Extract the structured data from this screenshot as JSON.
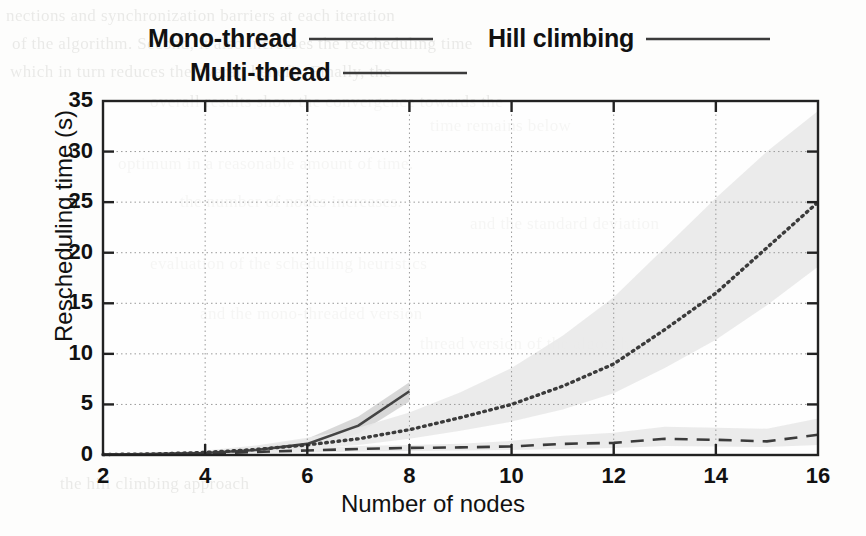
{
  "chart_data": {
    "type": "line",
    "title": "",
    "xlabel": "Number of nodes",
    "ylabel": "Rescheduling time (s)",
    "xlim": [
      2,
      16
    ],
    "ylim": [
      0,
      35
    ],
    "xticks": [
      2,
      4,
      6,
      8,
      10,
      12,
      14,
      16
    ],
    "yticks": [
      0,
      5,
      10,
      15,
      20,
      25,
      30,
      35
    ],
    "grid": true,
    "legend_position": "above-plot",
    "x": [
      2,
      3,
      4,
      5,
      6,
      7,
      8,
      9,
      10,
      11,
      12,
      13,
      14,
      15,
      16
    ],
    "series": [
      {
        "name": "Mono-thread",
        "style": "solid",
        "color": "#444444",
        "x": [
          2,
          3,
          4,
          5,
          6,
          7,
          8
        ],
        "values": [
          0.05,
          0.1,
          0.2,
          0.5,
          1.1,
          2.9,
          6.3
        ],
        "band_low": [
          0.02,
          0.05,
          0.12,
          0.3,
          0.7,
          2.1,
          5.3
        ],
        "band_high": [
          0.1,
          0.18,
          0.35,
          0.8,
          1.6,
          3.8,
          7.2
        ]
      },
      {
        "name": "Multi-thread",
        "style": "dashed",
        "color": "#3b3b3b",
        "x": [
          2,
          3,
          4,
          5,
          6,
          7,
          8,
          9,
          10,
          11,
          12,
          13,
          14,
          15,
          16
        ],
        "values": [
          0.05,
          0.08,
          0.15,
          0.3,
          0.45,
          0.6,
          0.7,
          0.75,
          0.85,
          1.1,
          1.2,
          1.6,
          1.5,
          1.35,
          2.0
        ],
        "band_low": [
          0.02,
          0.04,
          0.08,
          0.15,
          0.25,
          0.35,
          0.4,
          0.45,
          0.5,
          0.6,
          0.7,
          0.9,
          0.85,
          0.8,
          1.0
        ],
        "band_high": [
          0.1,
          0.14,
          0.25,
          0.5,
          0.7,
          0.9,
          1.0,
          1.1,
          1.4,
          1.9,
          2.2,
          2.8,
          2.7,
          2.6,
          3.6
        ]
      },
      {
        "name": "Hill climbing",
        "style": "dotted",
        "color": "#3b3b3b",
        "x": [
          2,
          3,
          4,
          5,
          6,
          7,
          8,
          9,
          10,
          11,
          12,
          13,
          14,
          15,
          16
        ],
        "values": [
          0.05,
          0.1,
          0.25,
          0.55,
          1.0,
          1.6,
          2.5,
          3.7,
          5.0,
          6.8,
          9.0,
          12.4,
          16.0,
          20.5,
          25.0
        ],
        "band_low": [
          0.02,
          0.05,
          0.15,
          0.35,
          0.6,
          1.0,
          1.6,
          2.4,
          3.3,
          4.5,
          6.1,
          8.6,
          11.4,
          14.8,
          18.6
        ],
        "band_high": [
          0.12,
          0.22,
          0.45,
          0.95,
          1.7,
          2.7,
          4.2,
          6.2,
          8.6,
          11.8,
          15.6,
          20.5,
          25.4,
          30.0,
          34.0
        ]
      }
    ]
  },
  "legend": {
    "items": [
      {
        "label": "Mono-thread",
        "style": "solid"
      },
      {
        "label": "Multi-thread",
        "style": "solid"
      },
      {
        "label": "Hill climbing",
        "style": "solid"
      }
    ]
  },
  "axes": {
    "y_title": "Rescheduling time (s)",
    "x_title": "Number of nodes",
    "y_ticks": [
      "0",
      "5",
      "10",
      "15",
      "20",
      "25",
      "30",
      "35"
    ],
    "x_ticks": [
      "2",
      "4",
      "6",
      "8",
      "10",
      "12",
      "14",
      "16"
    ]
  },
  "colors": {
    "band": "#e9e9e9",
    "band_dark": "#d4d4d4",
    "line": "#3b3b3b",
    "axis": "#222222",
    "grid": "#9a9a9a",
    "page": "#fdfdfc"
  },
  "background_text": {
    "lines": [
      "nections and synchronization barriers at each iteration",
      "of the algorithm. Second, it also increases the rescheduling time",
      "which in turn reduces the overall benefit. Finally, the",
      "overall results show the convergence towards the",
      "optimum in a reasonable amount of time.",
      "the number of nodes increases.",
      "evaluation of the scheduling heuristics",
      "and the mono-threaded version",
      "thread version of the algorithm",
      "the hill climbing approach",
      "time remains below",
      "and the standard deviation"
    ]
  }
}
